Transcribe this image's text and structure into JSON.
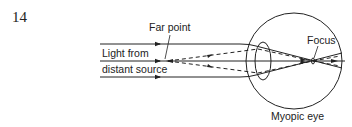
{
  "figure_number": "14",
  "labels": {
    "far_point": "Far point",
    "light_from": "Light from",
    "distant_source": "distant source",
    "focus": "Focus",
    "myopic_eye": "Myopic eye"
  },
  "colors": {
    "stroke": "#222222",
    "background": "#ffffff"
  }
}
